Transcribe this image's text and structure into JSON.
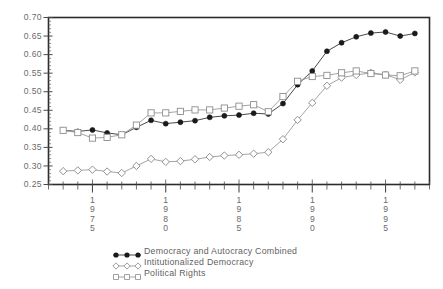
{
  "chart_data": {
    "type": "line",
    "title": "",
    "xlabel": "",
    "ylabel": "",
    "xlim": [
      1972,
      1998
    ],
    "ylim": [
      0.25,
      0.7
    ],
    "grid": false,
    "legend_position": "bottom-center",
    "y_ticks": [
      "0.70",
      "0.65",
      "0.60",
      "0.55",
      "0.50",
      "0.45",
      "0.40",
      "0.35",
      "0.30",
      "0.25"
    ],
    "y_tick_values": [
      0.7,
      0.65,
      0.6,
      0.55,
      0.5,
      0.45,
      0.4,
      0.35,
      0.3,
      0.25
    ],
    "x_tick_labels": [
      "1975",
      "1980",
      "1985",
      "1990",
      "1995"
    ],
    "x_tick_values": [
      1975,
      1980,
      1985,
      1990,
      1995
    ],
    "x": [
      1973,
      1974,
      1975,
      1976,
      1977,
      1978,
      1979,
      1980,
      1981,
      1982,
      1983,
      1984,
      1985,
      1986,
      1987,
      1988,
      1989,
      1990,
      1991,
      1992,
      1993,
      1994,
      1995,
      1996,
      1997
    ],
    "series": [
      {
        "name": "Democracy and Autocracy Combined",
        "marker": "filled-circle",
        "color": "#1a1a1a",
        "values": [
          0.396,
          0.393,
          0.397,
          0.389,
          0.384,
          0.404,
          0.423,
          0.414,
          0.418,
          0.422,
          0.431,
          0.435,
          0.437,
          0.442,
          0.44,
          0.468,
          0.519,
          0.556,
          0.609,
          0.632,
          0.648,
          0.658,
          0.661,
          0.65,
          0.657
        ]
      },
      {
        "name": "Intitutionalized Democracy",
        "marker": "open-diamond",
        "color": "#8d8d8d",
        "values": [
          0.286,
          0.288,
          0.29,
          0.285,
          0.281,
          0.3,
          0.319,
          0.311,
          0.313,
          0.318,
          0.324,
          0.328,
          0.33,
          0.333,
          0.337,
          0.372,
          0.424,
          0.47,
          0.516,
          0.538,
          0.545,
          0.551,
          0.546,
          0.532,
          0.552
        ]
      },
      {
        "name": "Political Rights",
        "marker": "open-square",
        "color": "#8d8d8d",
        "values": [
          0.396,
          0.39,
          0.375,
          0.377,
          0.384,
          0.41,
          0.443,
          0.443,
          0.447,
          0.451,
          0.451,
          0.456,
          0.461,
          0.465,
          0.446,
          0.487,
          0.528,
          0.541,
          0.544,
          0.551,
          0.556,
          0.549,
          0.545,
          0.543,
          0.556
        ]
      }
    ]
  },
  "legend": {
    "items": [
      {
        "label": "Democracy and Autocracy Combined",
        "marker": "filled-circle"
      },
      {
        "label": "Intitutionalized Democracy",
        "marker": "open-diamond"
      },
      {
        "label": "Political Rights",
        "marker": "open-square"
      }
    ]
  },
  "colors": {
    "axis": "#2b2b2b",
    "tick_text": "#6a6a6a",
    "series_combined": "#1a1a1a",
    "series_democracy": "#8d8d8d",
    "series_rights": "#8d8d8d",
    "background": "#ffffff"
  }
}
